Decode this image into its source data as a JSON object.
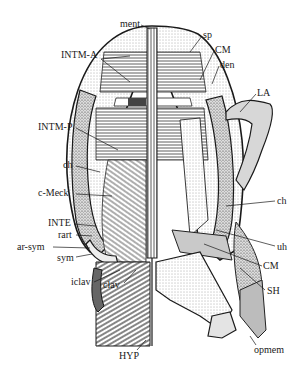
{
  "figure": {
    "colors": {
      "ink": "#1a1a1a",
      "paper": "#ffffff",
      "stipple": "#cfcfcf",
      "shade": "#8a8a8a"
    }
  },
  "labels": {
    "ment": {
      "text": "ment",
      "x": 120,
      "y": 19
    },
    "sp": {
      "text": "sp",
      "x": 203,
      "y": 30
    },
    "CM_top": {
      "text": "CM",
      "x": 215,
      "y": 45
    },
    "den": {
      "text": "den",
      "x": 220,
      "y": 60
    },
    "INTM_A": {
      "text": "INTM-A",
      "x": 61,
      "y": 50
    },
    "LA": {
      "text": "LA",
      "x": 257,
      "y": 88
    },
    "INTM_P": {
      "text": "INTM-P",
      "x": 38,
      "y": 122
    },
    "ch_left": {
      "text": "ch",
      "x": 63,
      "y": 160
    },
    "c_Meck": {
      "text": "c-Meck",
      "x": 38,
      "y": 188
    },
    "ch_right": {
      "text": "ch",
      "x": 277,
      "y": 196
    },
    "INTE": {
      "text": "INTE",
      "x": 48,
      "y": 218
    },
    "rart": {
      "text": "rart",
      "x": 58,
      "y": 230
    },
    "ar_sym": {
      "text": "ar-sym",
      "x": 17,
      "y": 242
    },
    "uh": {
      "text": "uh",
      "x": 277,
      "y": 242
    },
    "sym": {
      "text": "sym",
      "x": 57,
      "y": 253
    },
    "CM_bottom": {
      "text": "CM",
      "x": 263,
      "y": 261
    },
    "SH": {
      "text": "SH",
      "x": 267,
      "y": 286
    },
    "iclav": {
      "text": "iclav",
      "x": 71,
      "y": 277
    },
    "clav": {
      "text": "clav",
      "x": 103,
      "y": 280
    },
    "HYP": {
      "text": "HYP",
      "x": 119,
      "y": 351
    },
    "opmem": {
      "text": "opmem",
      "x": 254,
      "y": 345
    }
  }
}
